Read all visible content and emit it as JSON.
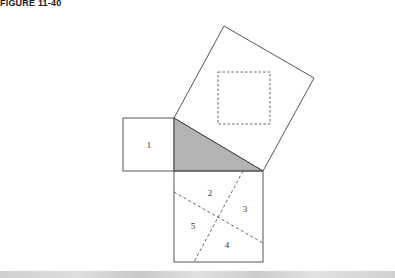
{
  "figure": {
    "title": "FIGURE 11-40",
    "colors": {
      "stroke": "#555555",
      "triangle_fill": "#b3b3b3",
      "dash_stroke": "#666666",
      "background": "#ffffff"
    },
    "shapes": {
      "hypotenuse_square": {
        "points": "174,118 224,26 314,78 263,171"
      },
      "inner_dashed_square": {
        "x": 218,
        "y": 72,
        "width": 52,
        "height": 52
      },
      "small_square": {
        "x": 123,
        "y": 118,
        "width": 51,
        "height": 53
      },
      "right_triangle": {
        "points": "174,118 174,171 263,171"
      },
      "large_square": {
        "x": 174,
        "y": 171,
        "width": 89,
        "height": 91
      },
      "dashed_line_a": {
        "x1": 243,
        "y1": 171,
        "x2": 194,
        "y2": 262
      },
      "dashed_line_b": {
        "x1": 174,
        "y1": 192,
        "x2": 263,
        "y2": 243
      }
    },
    "labels": [
      {
        "text": "1",
        "x": 149,
        "y": 148
      },
      {
        "text": "2",
        "x": 210,
        "y": 196
      },
      {
        "text": "3",
        "x": 245,
        "y": 212
      },
      {
        "text": "5",
        "x": 193,
        "y": 229
      },
      {
        "text": "4",
        "x": 227,
        "y": 248
      }
    ]
  }
}
